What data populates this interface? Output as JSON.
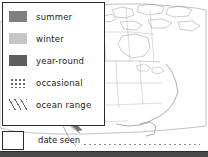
{
  "legend": {
    "items": [
      {
        "label": "summer",
        "swatch": "solid-fill-swatch",
        "color": "#808080"
      },
      {
        "label": "winter",
        "swatch": "solid-fill-swatch",
        "color": "#c6c6c6"
      },
      {
        "label": "year-round",
        "swatch": "solid-fill-swatch",
        "color": "#5e5e5e"
      },
      {
        "label": "occasional",
        "swatch": "dotted-fill-swatch",
        "color": "#6a6a6a"
      },
      {
        "label": "ocean range",
        "swatch": "hatched-fill-swatch",
        "color": "#6a6a6a"
      }
    ]
  },
  "date_seen": {
    "label": "date seen",
    "value": ""
  },
  "map": {
    "title": "north-america-range-map",
    "coast_shading_color": "#6f7378",
    "outline_color": "#8c8c8c"
  },
  "colors": {
    "border": "#2b2b2b",
    "text": "#222222",
    "bottom_bar": "#4a4a4a",
    "background": "#ffffff"
  }
}
